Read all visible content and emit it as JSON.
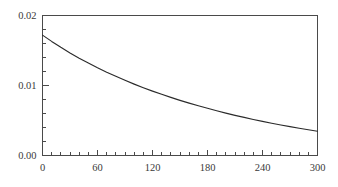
{
  "chart_data": {
    "type": "line",
    "title": "",
    "subtitle": "",
    "xlabel": "",
    "ylabel": "",
    "xlim": [
      0,
      300
    ],
    "ylim": [
      0.0,
      0.02
    ],
    "grid": false,
    "legend": null,
    "x_ticks": [
      0,
      60,
      120,
      180,
      240,
      300
    ],
    "x_tick_labels": [
      "0",
      "60",
      "120",
      "180",
      "240",
      "300"
    ],
    "x_minor_step": 10,
    "y_ticks": [
      0.0,
      0.01,
      0.02
    ],
    "y_tick_labels": [
      "0.00",
      "0.01",
      "0.02"
    ],
    "y_minor_step": 0.002,
    "series": [
      {
        "name": "decay",
        "color": "#2b2b2b",
        "x": [
          0,
          10,
          20,
          30,
          40,
          50,
          60,
          70,
          80,
          90,
          100,
          110,
          120,
          130,
          140,
          150,
          160,
          170,
          180,
          190,
          200,
          210,
          220,
          230,
          240,
          250,
          260,
          270,
          280,
          290,
          300
        ],
        "values": [
          0.0172,
          0.0163,
          0.01545,
          0.01465,
          0.0139,
          0.0132,
          0.01253,
          0.0119,
          0.01131,
          0.01074,
          0.0102,
          0.00969,
          0.0092,
          0.00874,
          0.0083,
          0.00788,
          0.00748,
          0.0071,
          0.00674,
          0.00639,
          0.00606,
          0.00574,
          0.00544,
          0.00515,
          0.00487,
          0.00461,
          0.00436,
          0.00412,
          0.00389,
          0.00368,
          0.00347
        ]
      }
    ]
  },
  "axes": {
    "frame_color": "#4a4a4a",
    "tick_color": "#4a4a4a",
    "label_color": "#3a3a3a"
  }
}
